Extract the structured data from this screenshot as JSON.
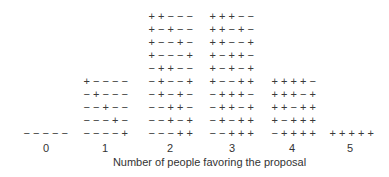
{
  "chart_data": {
    "type": "dot-histogram",
    "title": "",
    "xlabel": "Number of people favoring the proposal",
    "ylabel": "",
    "categories": [
      "0",
      "1",
      "2",
      "3",
      "4",
      "5"
    ],
    "counts": [
      1,
      5,
      10,
      10,
      5,
      1
    ],
    "columns": [
      {
        "label": "0",
        "sequences": [
          "-----"
        ]
      },
      {
        "label": "1",
        "sequences": [
          "----+",
          "---+-",
          "--+--",
          "-+---",
          "+----"
        ]
      },
      {
        "label": "2",
        "sequences": [
          "---++",
          "--+-+",
          "--++-",
          "-+-+-",
          "-+--+",
          "-++--",
          "+---+",
          "+--+-",
          "+-+--",
          "++---"
        ]
      },
      {
        "label": "3",
        "sequences": [
          "--+++",
          "-+-++",
          "-++-+",
          "-+++-",
          "+--++",
          "+-+-+",
          "+-++-",
          "++--+",
          "++-+-",
          "+++--"
        ]
      },
      {
        "label": "4",
        "sequences": [
          "-++++",
          "+-+++",
          "++-++",
          "+++-+",
          "++++-"
        ]
      },
      {
        "label": "5",
        "sequences": [
          "+++++"
        ]
      }
    ],
    "grid": false,
    "legend": null
  },
  "layout": {
    "column_left_px": [
      22,
      82,
      147,
      208,
      270,
      328
    ],
    "tick_center_px": [
      46,
      105,
      170,
      232,
      292,
      350
    ]
  }
}
